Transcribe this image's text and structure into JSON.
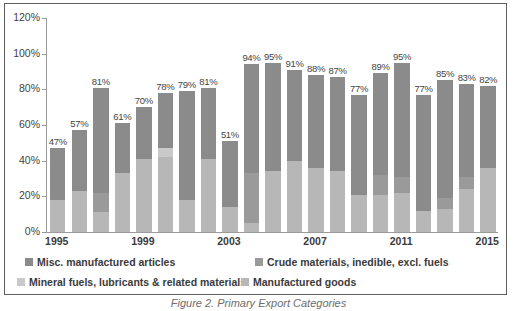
{
  "chart_data": {
    "type": "bar",
    "subtype": "stacked-bar",
    "title": "",
    "xlabel": "",
    "ylabel": "",
    "ylim": [
      0,
      120
    ],
    "ytick_labels": [
      "0%",
      "20%",
      "40%",
      "60%",
      "80%",
      "100%",
      "120%"
    ],
    "ytick_values": [
      0,
      20,
      40,
      60,
      80,
      100,
      120
    ],
    "grid": false,
    "legend_position": "bottom",
    "categories": [
      "1995",
      "1996",
      "1997",
      "1998",
      "1999",
      "2000",
      "2001",
      "2002",
      "2003",
      "2004",
      "2005",
      "2006",
      "2007",
      "2008",
      "2009",
      "2010",
      "2011",
      "2012",
      "2013",
      "2014",
      "2015"
    ],
    "xtick_labels_shown": [
      "1995",
      "1999",
      "2003",
      "2007",
      "2011",
      "2015"
    ],
    "series": [
      {
        "name": "Manufactured goods",
        "color": "#b7b7b7",
        "values": [
          18,
          23,
          11,
          33,
          41,
          42,
          18,
          41,
          14,
          5,
          34,
          40,
          36,
          34,
          21,
          21,
          22,
          12,
          13,
          24,
          36
        ]
      },
      {
        "name": "Mineral fuels, lubricants & related materials",
        "color": "#c9c9c9",
        "values": [
          0,
          0,
          0,
          0,
          0,
          5,
          0,
          0,
          0,
          0,
          0,
          0,
          0,
          0,
          0,
          0,
          0,
          0,
          0,
          0,
          0
        ]
      },
      {
        "name": "Crude materials, inedible, excl. fuels",
        "color": "#9a9a9a",
        "values": [
          0,
          0,
          11,
          0,
          0,
          0,
          0,
          0,
          0,
          28,
          0,
          0,
          0,
          0,
          0,
          11,
          9,
          0,
          6,
          7,
          0
        ]
      },
      {
        "name": "Misc. manufactured articles",
        "color": "#8b8b8b",
        "values": [
          29,
          34,
          59,
          28,
          29,
          31,
          61,
          40,
          37,
          61,
          61,
          51,
          52,
          53,
          56,
          57,
          64,
          65,
          66,
          52,
          46
        ]
      }
    ],
    "totals": [
      47,
      57,
      81,
      61,
      70,
      78,
      79,
      81,
      51,
      94,
      95,
      91,
      88,
      87,
      77,
      89,
      95,
      77,
      85,
      83,
      82
    ],
    "data_labels": [
      "47%",
      "57%",
      "81%",
      "61%",
      "70%",
      "78%",
      "79%",
      "81%",
      "51%",
      "94%",
      "95%",
      "91%",
      "88%",
      "87%",
      "77%",
      "89%",
      "95%",
      "77%",
      "85%",
      "83%",
      "82%"
    ]
  },
  "legend": {
    "items": [
      {
        "label": "Misc. manufactured articles",
        "color": "#8b8b8b"
      },
      {
        "label": "Crude materials, inedible, excl. fuels",
        "color": "#9a9a9a"
      },
      {
        "label": "Mineral fuels, lubricants & related materials",
        "color": "#c9c9c9"
      },
      {
        "label": "Manufactured goods",
        "color": "#b7b7b7"
      }
    ]
  },
  "caption": {
    "text": "Figure 2. Primary Export Categories"
  }
}
